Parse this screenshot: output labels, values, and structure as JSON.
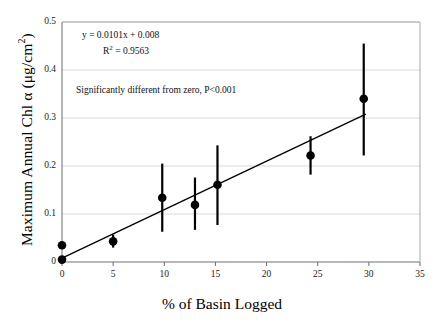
{
  "chart_data": {
    "type": "scatter",
    "title": "",
    "xlabel": "% of Basin Logged",
    "ylabel": "Maximum Annual Chl α (μg/cm²)",
    "ylabel_main": "Maximum Annual Chl α (μg/cm",
    "ylabel_sup": "2",
    "ylabel_tail": ")",
    "xlim": [
      0,
      35
    ],
    "ylim": [
      0,
      0.5
    ],
    "xticks": [
      "0",
      "5",
      "10",
      "15",
      "20",
      "25",
      "30",
      "35"
    ],
    "xtick_values": [
      0,
      5,
      10,
      15,
      20,
      25,
      30,
      35
    ],
    "yticks": [
      "0",
      "0.1",
      "0.2",
      "0.3",
      "0.4",
      "0.5"
    ],
    "ytick_values": [
      0,
      0.1,
      0.2,
      0.3,
      0.4,
      0.5
    ],
    "grid": "horizontal",
    "legend": "none",
    "marker": "filled-circle",
    "marker_color": "#000000",
    "line_color": "#000000",
    "grid_color": "#d9d9d9",
    "axis_color": "#808080",
    "points": [
      {
        "x": 0.0,
        "y": 0.035,
        "err_low": 0.035,
        "err_high": 0.035
      },
      {
        "x": 0.0,
        "y": 0.005,
        "err_low": 0.0,
        "err_high": 0.01
      },
      {
        "x": 5.0,
        "y": 0.043,
        "err_low": 0.03,
        "err_high": 0.057
      },
      {
        "x": 9.8,
        "y": 0.134,
        "err_low": 0.063,
        "err_high": 0.205
      },
      {
        "x": 13.0,
        "y": 0.119,
        "err_low": 0.067,
        "err_high": 0.176
      },
      {
        "x": 15.2,
        "y": 0.161,
        "err_low": 0.077,
        "err_high": 0.243
      },
      {
        "x": 24.3,
        "y": 0.222,
        "err_low": 0.182,
        "err_high": 0.262
      },
      {
        "x": 29.5,
        "y": 0.34,
        "err_low": 0.222,
        "err_high": 0.455
      }
    ],
    "regression": {
      "slope": 0.0101,
      "intercept": 0.008,
      "r_squared": 0.9563,
      "x_start": 0,
      "x_end": 29.7
    },
    "annotations": {
      "equation_main": "y = 0.0101x + 0.008",
      "r2_prefix": "R",
      "r2_sup": "2",
      "r2_value": " = 0.9563",
      "significance": "Significantly different from zero, P<0.001"
    }
  }
}
